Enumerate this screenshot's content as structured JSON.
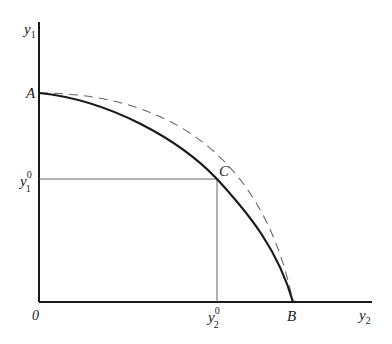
{
  "diagram": {
    "type": "production-possibility-frontier",
    "axes": {
      "y_axis_label": "y",
      "y_axis_sub": "1",
      "x_axis_label": "y",
      "x_axis_sub": "2",
      "origin_label": "0"
    },
    "points": {
      "A": {
        "label": "A"
      },
      "B": {
        "label": "B"
      },
      "C": {
        "label": "C"
      }
    },
    "ticks": {
      "y1_0": {
        "base": "y",
        "sup": "0",
        "sub": "1"
      },
      "y2_0": {
        "base": "y",
        "sup": "0",
        "sub": "2"
      }
    },
    "curves": [
      {
        "name": "solid-frontier",
        "style": "solid",
        "from": "A",
        "to": "B",
        "through": "C"
      },
      {
        "name": "dashed-frontier",
        "style": "dashed",
        "from": "A",
        "to": "B"
      }
    ],
    "colors": {
      "stroke": "#1a1a1a",
      "guide": "#555555",
      "dashed": "#666666"
    }
  }
}
